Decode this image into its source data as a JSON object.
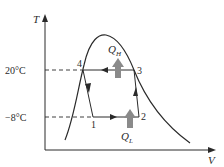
{
  "diagram": {
    "type": "T-V diagram of refrigeration cycle",
    "axes": {
      "y_label": "T",
      "x_label": "V"
    },
    "temperatures": {
      "high": "20°C",
      "low": "−8°C"
    },
    "states": {
      "p1": "1",
      "p2": "2",
      "p3": "3",
      "p4": "4"
    },
    "heat": {
      "high": "Q",
      "high_sub": "H",
      "low": "Q",
      "low_sub": "L"
    },
    "colors": {
      "line": "#2a2a2a",
      "heat_arrow": "#8a8a8a"
    }
  }
}
